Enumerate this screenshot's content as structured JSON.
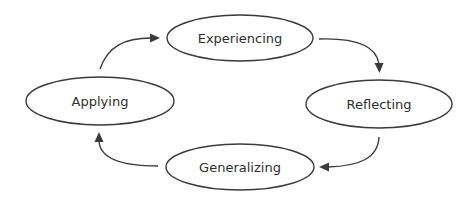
{
  "diagram": {
    "type": "cycle",
    "nodes": [
      {
        "id": "experiencing",
        "label": "Experiencing",
        "cx": 240,
        "cy": 38,
        "rx": 73,
        "ry": 23
      },
      {
        "id": "reflecting",
        "label": "Reflecting",
        "cx": 379,
        "cy": 104,
        "rx": 73,
        "ry": 24
      },
      {
        "id": "generalizing",
        "label": "Generalizing",
        "cx": 240,
        "cy": 167,
        "rx": 74,
        "ry": 23
      },
      {
        "id": "applying",
        "label": "Applying",
        "cx": 100,
        "cy": 101,
        "rx": 74,
        "ry": 24
      }
    ],
    "edges": [
      {
        "from": "experiencing",
        "to": "reflecting"
      },
      {
        "from": "reflecting",
        "to": "generalizing"
      },
      {
        "from": "generalizing",
        "to": "applying"
      },
      {
        "from": "applying",
        "to": "experiencing"
      }
    ],
    "colors": {
      "stroke": "#3a3a3a",
      "text": "#2e2e2e",
      "background": "#ffffff"
    }
  }
}
